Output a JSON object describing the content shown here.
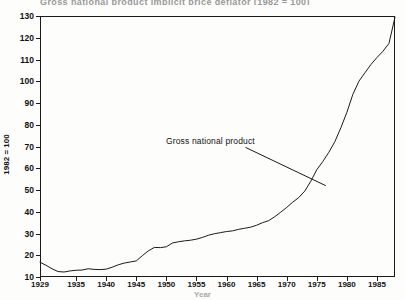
{
  "figure": {
    "title_partial": "Gross national product implicit price deflator  (1982 = 100)",
    "annotation_label": "Gross national product",
    "x_axis_title": "Year"
  },
  "chart_data": {
    "type": "line",
    "title": "Gross national product implicit price deflator",
    "xlabel": "Year",
    "ylabel": "1982 = 100",
    "xlim": [
      1929,
      1988
    ],
    "ylim": [
      10,
      130
    ],
    "ytick_values": [
      10,
      20,
      30,
      40,
      50,
      60,
      70,
      80,
      90,
      100,
      110,
      120,
      130
    ],
    "ytick_labels": [
      "10",
      "20",
      "30",
      "40",
      "50",
      "60",
      "70",
      "80",
      "90",
      "100",
      "110",
      "120",
      "130"
    ],
    "xtick_values": [
      1929,
      1935,
      1940,
      1945,
      1950,
      1955,
      1960,
      1965,
      1970,
      1975,
      1980,
      1985
    ],
    "xtick_labels": [
      "1929",
      "1935",
      "1940",
      "1945",
      "1950",
      "1955",
      "1960",
      "1965",
      "1970",
      "1975",
      "1980",
      "1985"
    ],
    "grid": false,
    "legend": false,
    "annotations": [
      {
        "text": "Gross national product",
        "text_x": 1956.5,
        "text_y": 70.5,
        "point_x": 1976.5,
        "point_y": 52.0
      }
    ],
    "series": [
      {
        "name": "Gross national product implicit price deflator",
        "color": "#1a1a1a",
        "x": [
          1929,
          1930,
          1931,
          1932,
          1933,
          1934,
          1935,
          1936,
          1937,
          1938,
          1939,
          1940,
          1941,
          1942,
          1943,
          1944,
          1945,
          1946,
          1947,
          1948,
          1949,
          1950,
          1951,
          1952,
          1953,
          1954,
          1955,
          1956,
          1957,
          1958,
          1959,
          1960,
          1961,
          1962,
          1963,
          1964,
          1965,
          1966,
          1967,
          1968,
          1969,
          1970,
          1971,
          1972,
          1973,
          1974,
          1975,
          1976,
          1977,
          1978,
          1979,
          1980,
          1981,
          1982,
          1983,
          1984,
          1985,
          1986,
          1987,
          1988
        ],
        "y": [
          16.8,
          15.4,
          13.8,
          12.5,
          12.3,
          12.8,
          13.1,
          13.2,
          13.8,
          13.5,
          13.4,
          13.6,
          14.5,
          15.6,
          16.4,
          16.9,
          17.4,
          19.8,
          22.0,
          23.6,
          23.5,
          23.9,
          25.6,
          26.2,
          26.6,
          26.9,
          27.4,
          28.2,
          29.2,
          29.9,
          30.4,
          30.9,
          31.2,
          31.9,
          32.4,
          32.9,
          33.8,
          35.0,
          35.9,
          37.7,
          39.8,
          42.0,
          44.4,
          46.5,
          49.5,
          54.0,
          59.3,
          63.1,
          67.3,
          72.2,
          78.6,
          85.7,
          94.0,
          100.0,
          103.9,
          107.7,
          110.9,
          113.8,
          117.4,
          129.5
        ]
      }
    ]
  }
}
